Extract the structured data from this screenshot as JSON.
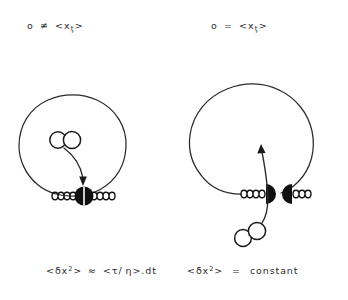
{
  "figure": {
    "title_left": "o ≠ <xₘ>",
    "title_right": "o = <xₘ>",
    "panels": [
      {
        "id": "left-panel",
        "label": "o ≠ <xₘ>",
        "label_parts": {
          "lhs": "o",
          "relation": "≠",
          "bracket_open": "<",
          "variable": "x",
          "subscript": "ƫ",
          "bracket_close": ">"
        },
        "equation": "<δx²> ≈ <τ/ η> . dt",
        "equation_parts": {
          "bracket_open": "<",
          "delta": "δ",
          "variable": "x",
          "exponent": "2",
          "bracket_close": ">",
          "relation": "≈",
          "rhs_open": "<",
          "tau": "τ",
          "slash": "/",
          "eta": "η",
          "rhs_close": ">",
          "dot": ".",
          "dt": "dt"
        },
        "ring_state": "closed",
        "bead_state": "joined-split-bead",
        "particle_position": "inside",
        "arrow_direction": "down-into-bead"
      },
      {
        "id": "right-panel",
        "label": "o = <xₘ>",
        "label_parts": {
          "lhs": "o",
          "relation": "=",
          "bracket_open": "<",
          "variable": "x",
          "subscript": "ƫ",
          "bracket_close": ">"
        },
        "equation": "<δx²>  =  constant",
        "equation_parts": {
          "bracket_open": "<",
          "delta": "δ",
          "variable": "x",
          "exponent": "2",
          "bracket_close": ">",
          "relation": "=",
          "rhs": "constant"
        },
        "ring_state": "open",
        "bead_state": "separated-halves",
        "particle_position": "outside-below",
        "arrow_direction": "up-into-gap"
      }
    ],
    "colors": {
      "ink": "#1a1a1a",
      "stroke": "#2b2b2b",
      "background": "#ffffff",
      "bead_fill": "#111111"
    }
  }
}
